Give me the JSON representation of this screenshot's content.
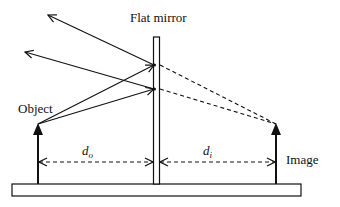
{
  "diagram": {
    "title": "Flat mirror",
    "labels": {
      "mirror": "Flat mirror",
      "object": "Object",
      "image": "Image",
      "object_distance": "d",
      "object_distance_sub": "o",
      "image_distance": "d",
      "image_distance_sub": "i"
    },
    "colors": {
      "stroke": "#111111",
      "background": "#ffffff"
    }
  }
}
